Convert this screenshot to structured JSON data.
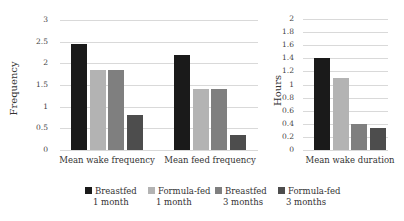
{
  "chart_data": [
    {
      "type": "bar",
      "title": "",
      "ylabel": "Frequency",
      "xlabel": "",
      "ylim": [
        0,
        3
      ],
      "yticks": [
        "0",
        "0.5",
        "1",
        "1.5",
        "2",
        "2.5",
        "3"
      ],
      "grid": true,
      "categories": [
        "Mean wake frequency",
        "Mean feed frequency"
      ],
      "series": [
        {
          "name": "Breastfed 1 month",
          "color": "#1a1a1a",
          "values": [
            2.45,
            2.2
          ]
        },
        {
          "name": "Formula-fed 1 month",
          "color": "#b3b3b3",
          "values": [
            1.85,
            1.4
          ]
        },
        {
          "name": "Breastfed 3 months",
          "color": "#7f7f7f",
          "values": [
            1.85,
            1.4
          ]
        },
        {
          "name": "Formula-fed 3 months",
          "color": "#4d4d4d",
          "values": [
            0.8,
            0.35
          ]
        }
      ]
    },
    {
      "type": "bar",
      "title": "",
      "ylabel": "Hours",
      "xlabel": "",
      "ylim": [
        0,
        2
      ],
      "yticks": [
        "0",
        "0.2",
        "0.4",
        "0.6",
        "0.8",
        "1",
        "1.2",
        "1.4",
        "1.6",
        "1.8",
        "2"
      ],
      "grid": true,
      "categories": [
        "Mean wake duration"
      ],
      "series": [
        {
          "name": "Breastfed 1 month",
          "color": "#1a1a1a",
          "values": [
            1.4
          ]
        },
        {
          "name": "Formula-fed 1 month",
          "color": "#b3b3b3",
          "values": [
            1.1
          ]
        },
        {
          "name": "Breastfed 3 months",
          "color": "#7f7f7f",
          "values": [
            0.4
          ]
        },
        {
          "name": "Formula-fed 3 months",
          "color": "#4d4d4d",
          "values": [
            0.33
          ]
        }
      ]
    }
  ],
  "legend": [
    {
      "line1": "Breastfed",
      "line2": "1 month",
      "color": "#1a1a1a"
    },
    {
      "line1": "Formula-fed",
      "line2": "1 month",
      "color": "#b3b3b3"
    },
    {
      "line1": "Breastfed",
      "line2": "3 months",
      "color": "#7f7f7f"
    },
    {
      "line1": "Formula-fed",
      "line2": "3 months",
      "color": "#4d4d4d"
    }
  ]
}
